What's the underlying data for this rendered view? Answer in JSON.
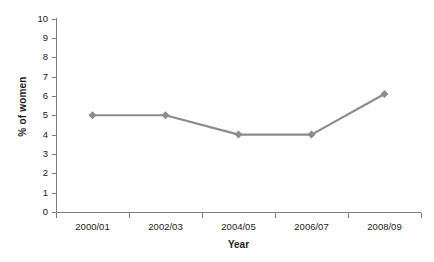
{
  "chart_data": {
    "type": "line",
    "title": "",
    "xlabel": "Year",
    "ylabel": "% of women",
    "categories": [
      "2000/01",
      "2002/03",
      "2004/05",
      "2006/07",
      "2008/09"
    ],
    "values": [
      5.0,
      5.0,
      4.0,
      4.0,
      6.1
    ],
    "series": [
      {
        "name": "% of women",
        "values": [
          5.0,
          5.0,
          4.0,
          4.0,
          6.1
        ]
      }
    ],
    "ylim": [
      0,
      10
    ],
    "y_ticks": [
      0,
      1,
      2,
      3,
      4,
      5,
      6,
      7,
      8,
      9,
      10
    ],
    "y_tick_labels": [
      "0",
      "1",
      "2",
      "3",
      "4",
      "5",
      "6",
      "7",
      "8",
      "9",
      "10"
    ],
    "grid": false,
    "legend": false,
    "marker": "diamond",
    "line_color": "#8c8c8c",
    "marker_color": "#8c8c8c",
    "axis_color": "#7d7d7d",
    "background": "#ffffff",
    "text_color": "#1b1b1b"
  }
}
